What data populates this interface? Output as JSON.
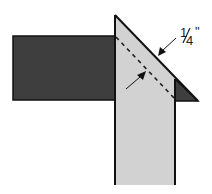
{
  "diagram": {
    "type": "seam-allowance-miter",
    "label": "1/4\"",
    "label_parts": {
      "num": "1",
      "den": "4",
      "unit": "\""
    },
    "colors": {
      "dark_strip": "#3e3e3e",
      "light_strip": "#d2d2d2",
      "outline": "#111111",
      "background": "#ffffff"
    },
    "elements": [
      {
        "name": "dark-horizontal-strip"
      },
      {
        "name": "light-vertical-strip-mitered"
      },
      {
        "name": "dark-corner-triangle"
      },
      {
        "name": "dashed-seam-line"
      },
      {
        "name": "arrow-to-cut-edge"
      },
      {
        "name": "arrow-to-seam-line"
      },
      {
        "name": "measurement-label"
      }
    ]
  }
}
